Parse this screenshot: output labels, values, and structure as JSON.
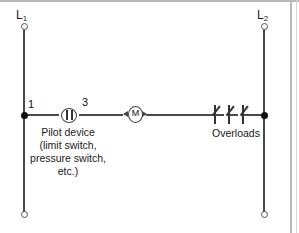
{
  "diagram": {
    "type": "electrical-ladder-control-circuit",
    "title": "",
    "rails": [
      {
        "id": "L1",
        "label": "L",
        "subscript": "1",
        "side": "left"
      },
      {
        "id": "L2",
        "label": "L",
        "subscript": "2",
        "side": "right"
      }
    ],
    "wire_numbers": {
      "left": "1",
      "after_pilot": "3"
    },
    "components": [
      {
        "name": "pilot-device",
        "symbol": "contact-in-circle",
        "caption_lines": [
          "Pilot device",
          "(limit switch,",
          "pressure switch,",
          "etc.)"
        ]
      },
      {
        "name": "motor-starter-coil",
        "symbol": "coil-M",
        "letter": "M",
        "caption": ""
      },
      {
        "name": "overload-contacts",
        "symbol": "overload-normally-closed",
        "count": 3,
        "caption": "Overloads"
      }
    ],
    "captions": {
      "pilot_line_1": "Pilot device",
      "pilot_line_2": "(limit switch,",
      "pilot_line_3": "pressure switch,",
      "pilot_line_4": "etc.)",
      "overloads": "Overloads"
    },
    "colors": {
      "background": "#ffffff",
      "wire": "#4a4a4a",
      "node": "#111111",
      "text": "#1a1a1a",
      "frame": "#b9b9b9"
    }
  }
}
